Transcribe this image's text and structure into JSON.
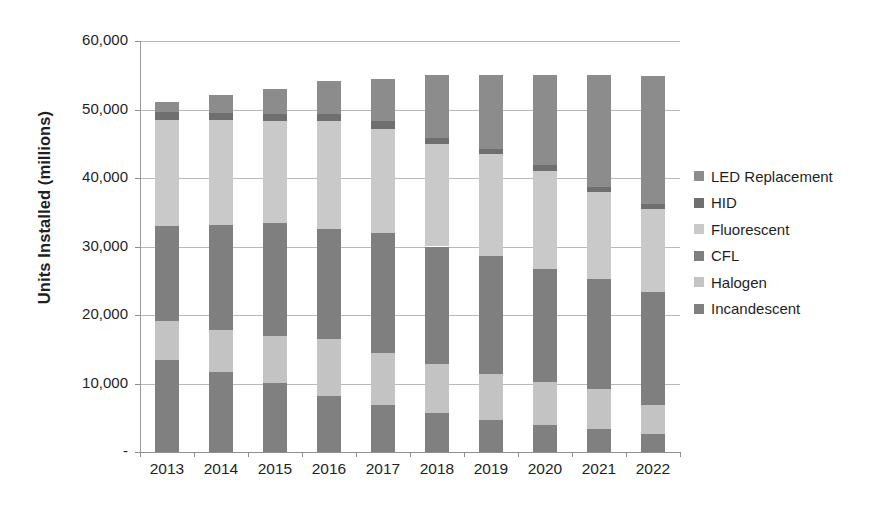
{
  "chart_data": {
    "type": "bar",
    "subtype": "stacked-bar",
    "title": "",
    "xlabel": "",
    "ylabel": "Units Installed (millions)",
    "categories": [
      "2013",
      "2014",
      "2015",
      "2016",
      "2017",
      "2018",
      "2019",
      "2020",
      "2021",
      "2022"
    ],
    "ylim": [
      0,
      60000
    ],
    "ytick_values": [
      0,
      10000,
      20000,
      30000,
      40000,
      50000,
      60000
    ],
    "ytick_labels": [
      "-",
      "10,000",
      "20,000",
      "30,000",
      "40,000",
      "50,000",
      "60,000"
    ],
    "grid": true,
    "legend_position": "right",
    "stack_order_bottom_to_top": [
      "Incandescent",
      "Halogen",
      "CFL",
      "Fluorescent",
      "HID",
      "LED Replacement"
    ],
    "series": [
      {
        "name": "Incandescent",
        "color": "#808080",
        "values": [
          13500,
          11700,
          10100,
          8200,
          6900,
          5700,
          4700,
          3900,
          3300,
          2700
        ]
      },
      {
        "name": "Halogen",
        "color": "#c3c3c3",
        "values": [
          5600,
          6100,
          6900,
          8300,
          7500,
          7100,
          6700,
          6300,
          5900,
          4200
        ]
      },
      {
        "name": "CFL",
        "color": "#7f7f7f",
        "values": [
          13900,
          15400,
          16400,
          16000,
          17500,
          17200,
          17200,
          16500,
          16000,
          16500
        ]
      },
      {
        "name": "Fluorescent",
        "color": "#c9c9c9",
        "values": [
          15500,
          15200,
          14900,
          15800,
          15300,
          14900,
          14900,
          14300,
          12800,
          12100
        ]
      },
      {
        "name": "HID",
        "color": "#6f6f6f",
        "values": [
          1100,
          1100,
          1100,
          1000,
          1100,
          900,
          800,
          900,
          700,
          700
        ]
      },
      {
        "name": "LED Replacement",
        "color": "#8c8c8c",
        "values": [
          1500,
          2600,
          3600,
          4800,
          6200,
          9200,
          10800,
          13200,
          16300,
          18700
        ]
      }
    ]
  },
  "legend": {
    "items": [
      {
        "label": "LED Replacement",
        "color": "#8c8c8c"
      },
      {
        "label": "HID",
        "color": "#6f6f6f"
      },
      {
        "label": "Fluorescent",
        "color": "#c9c9c9"
      },
      {
        "label": "CFL",
        "color": "#7f7f7f"
      },
      {
        "label": "Halogen",
        "color": "#c3c3c3"
      },
      {
        "label": "Incandescent",
        "color": "#808080"
      }
    ]
  },
  "axes": {
    "y_title": "Units Installed (millions)",
    "y_labels": [
      "60,000",
      "50,000",
      "40,000",
      "30,000",
      "20,000",
      "10,000",
      "-"
    ],
    "x_labels": [
      "2013",
      "2014",
      "2015",
      "2016",
      "2017",
      "2018",
      "2019",
      "2020",
      "2021",
      "2022"
    ]
  }
}
